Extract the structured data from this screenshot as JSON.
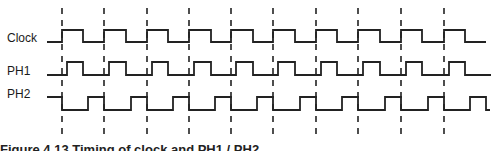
{
  "diagram": {
    "signals": [
      {
        "name": "Clock",
        "label_x": 7,
        "label_y": 31
      },
      {
        "name": "PH1",
        "label_x": 7,
        "label_y": 64
      },
      {
        "name": "PH2",
        "label_x": 7,
        "label_y": 87
      }
    ],
    "caption": "Figure 4.13 Timing of clock and PH1 / PH2",
    "colors": {
      "line": "#222222",
      "dash": "#222222",
      "background": "#ffffff"
    }
  },
  "chart_data": {
    "type": "timing",
    "period_px": 42.4,
    "cycles": 10,
    "clock_edges_x": [
      62,
      104,
      147,
      189,
      231,
      273,
      316,
      358,
      401,
      444
    ],
    "signals": [
      {
        "name": "Clock",
        "high_y": 30,
        "low_y": 42,
        "start_x": 47,
        "end_x": 486,
        "initial": "low",
        "pulses": [
          [
            62,
            83
          ],
          [
            104,
            126
          ],
          [
            147,
            168
          ],
          [
            189,
            211
          ],
          [
            231,
            253
          ],
          [
            273,
            295
          ],
          [
            316,
            337
          ],
          [
            358,
            380
          ],
          [
            401,
            422
          ],
          [
            444,
            465
          ]
        ]
      },
      {
        "name": "PH1",
        "high_y": 62,
        "low_y": 75,
        "start_x": 47,
        "end_x": 491,
        "initial": "low",
        "pulses": [
          [
            67,
            83
          ],
          [
            109,
            126
          ],
          [
            152,
            168
          ],
          [
            194,
            211
          ],
          [
            236,
            253
          ],
          [
            278,
            295
          ],
          [
            321,
            337
          ],
          [
            363,
            380
          ],
          [
            406,
            422
          ],
          [
            449,
            465
          ]
        ]
      },
      {
        "name": "PH2",
        "high_y": 97,
        "low_y": 110,
        "start_x": 47,
        "end_x": 490,
        "initial": "high",
        "pulses": [
          [
            47,
            62
          ],
          [
            88,
            104
          ],
          [
            131,
            147
          ],
          [
            173,
            189
          ],
          [
            215,
            231
          ],
          [
            257,
            273
          ],
          [
            300,
            316
          ],
          [
            342,
            358
          ],
          [
            385,
            401
          ],
          [
            428,
            444
          ],
          [
            470,
            486
          ]
        ]
      }
    ],
    "dash_y_range": [
      8,
      134
    ]
  }
}
